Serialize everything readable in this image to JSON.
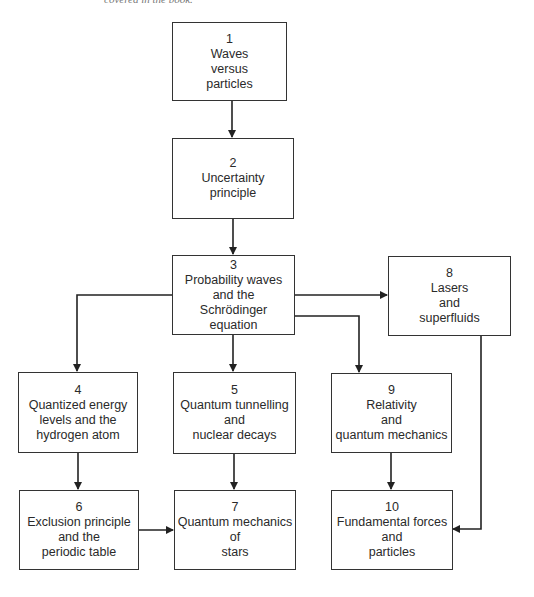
{
  "caption": "covered in the book.",
  "nodes": {
    "n1": {
      "num": "1",
      "lines": [
        "Waves",
        "versus",
        "particles"
      ]
    },
    "n2": {
      "num": "2",
      "lines": [
        "Uncertainty",
        "principle"
      ]
    },
    "n3": {
      "num": "3",
      "lines": [
        "Probability waves",
        "and the",
        "Schrödinger",
        "equation"
      ]
    },
    "n4": {
      "num": "4",
      "lines": [
        "Quantized energy",
        "levels and the",
        "hydrogen atom"
      ]
    },
    "n5": {
      "num": "5",
      "lines": [
        "Quantum tunnelling",
        "and",
        "nuclear decays"
      ]
    },
    "n6": {
      "num": "6",
      "lines": [
        "Exclusion principle",
        "and the",
        "periodic table"
      ]
    },
    "n7": {
      "num": "7",
      "lines": [
        "Quantum mechanics",
        "of",
        "stars"
      ]
    },
    "n8": {
      "num": "8",
      "lines": [
        "Lasers",
        "and",
        "superfluids"
      ]
    },
    "n9": {
      "num": "9",
      "lines": [
        "Relativity",
        "and",
        "quantum mechanics"
      ]
    },
    "n10": {
      "num": "10",
      "lines": [
        "Fundamental forces",
        "and",
        "particles"
      ]
    }
  },
  "edges": [
    [
      "1",
      "2"
    ],
    [
      "2",
      "3"
    ],
    [
      "3",
      "4"
    ],
    [
      "3",
      "5"
    ],
    [
      "3",
      "8"
    ],
    [
      "3",
      "9"
    ],
    [
      "4",
      "6"
    ],
    [
      "5",
      "7"
    ],
    [
      "6",
      "7"
    ],
    [
      "9",
      "10"
    ],
    [
      "8",
      "10"
    ]
  ],
  "colors": {
    "line": "#222222",
    "box_border": "#333333"
  }
}
